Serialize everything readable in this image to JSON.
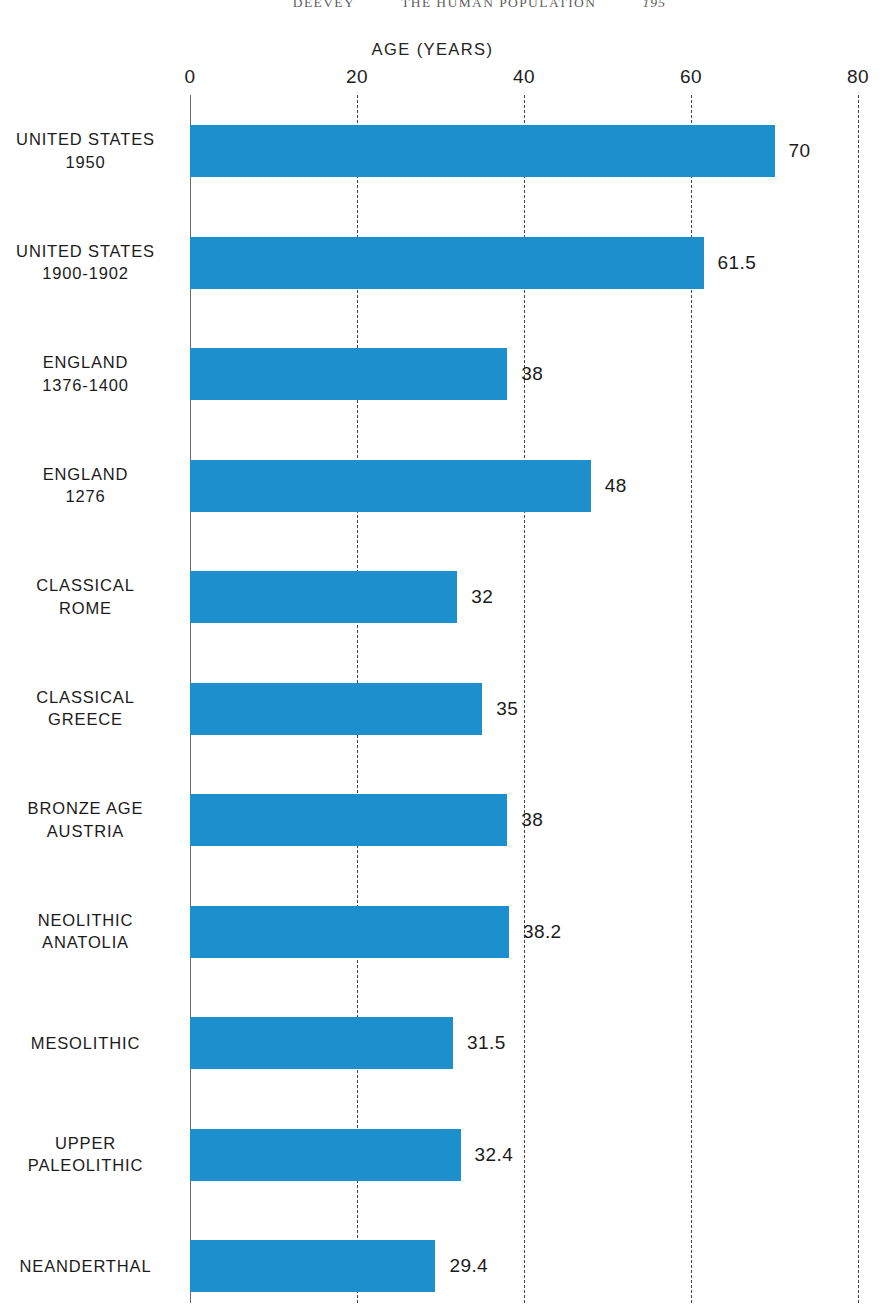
{
  "running_head": {
    "author": "DEEVEY",
    "title": "THE HUMAN POPULATION",
    "page": "195"
  },
  "chart_data": {
    "type": "bar",
    "orientation": "horizontal",
    "title": "AGE (YEARS)",
    "xlabel": "AGE (YEARS)",
    "ylabel": "",
    "xlim": [
      0,
      80
    ],
    "xticks": [
      0,
      20,
      40,
      60,
      80
    ],
    "xtick_labels": [
      "0",
      "20",
      "40",
      "60",
      "80"
    ],
    "grid": true,
    "grid_style": "dashed-vertical",
    "legend": "none",
    "bar_color": "#1e8fcd",
    "categories": [
      "UNITED STATES\n1950",
      "UNITED STATES\n1900-1902",
      "ENGLAND\n1376-1400",
      "ENGLAND\n1276",
      "CLASSICAL\nROME",
      "CLASSICAL\nGREECE",
      "BRONZE AGE\nAUSTRIA",
      "NEOLITHIC\nANATOLIA",
      "MESOLITHIC",
      "UPPER\nPALEOLITHIC",
      "NEANDERTHAL"
    ],
    "values": [
      70,
      61.5,
      38,
      48,
      32,
      35,
      38,
      38.2,
      31.5,
      32.4,
      29.4
    ],
    "value_labels": [
      "70",
      "61.5",
      "38",
      "48",
      "32",
      "35",
      "38",
      "38.2",
      "31.5",
      "32.4",
      "29.4"
    ],
    "rows": [
      {
        "label": "UNITED STATES\n1950",
        "value": 70,
        "value_label": "70"
      },
      {
        "label": "UNITED STATES\n1900-1902",
        "value": 61.5,
        "value_label": "61.5"
      },
      {
        "label": "ENGLAND\n1376-1400",
        "value": 38,
        "value_label": "38"
      },
      {
        "label": "ENGLAND\n1276",
        "value": 48,
        "value_label": "48"
      },
      {
        "label": "CLASSICAL\nROME",
        "value": 32,
        "value_label": "32"
      },
      {
        "label": "CLASSICAL\nGREECE",
        "value": 35,
        "value_label": "35"
      },
      {
        "label": "BRONZE AGE\nAUSTRIA",
        "value": 38,
        "value_label": "38"
      },
      {
        "label": "NEOLITHIC\nANATOLIA",
        "value": 38.2,
        "value_label": "38.2"
      },
      {
        "label": "MESOLITHIC",
        "value": 31.5,
        "value_label": "31.5"
      },
      {
        "label": "UPPER\nPALEOLITHIC",
        "value": 32.4,
        "value_label": "32.4"
      },
      {
        "label": "NEANDERTHAL",
        "value": 29.4,
        "value_label": "29.4"
      }
    ]
  }
}
